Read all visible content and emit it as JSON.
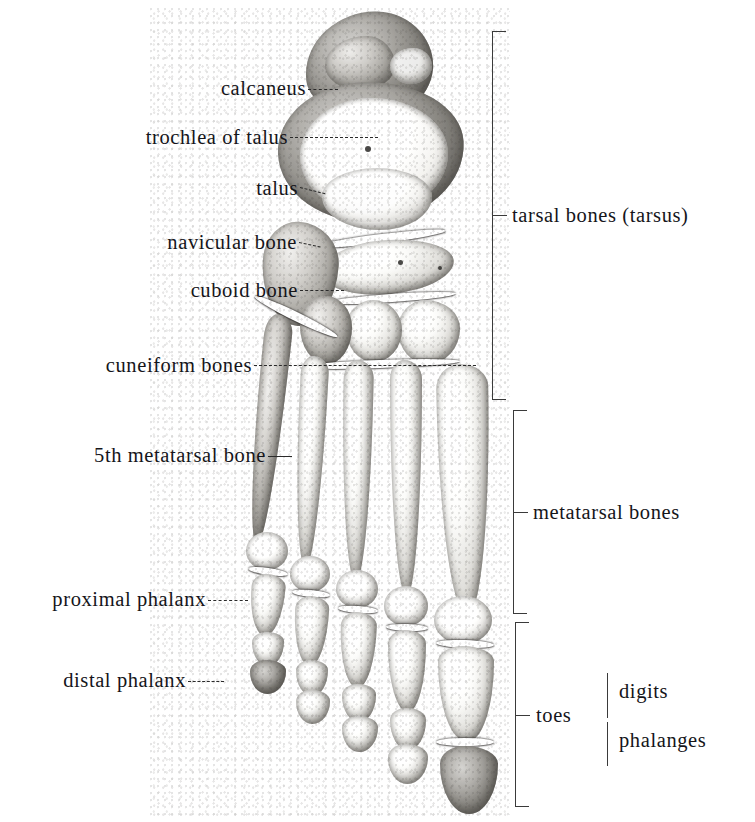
{
  "figure": {
    "style": "halftone grayscale anatomical photograph with leader-line labels"
  },
  "left_labels": [
    {
      "id": "calcaneus",
      "text": "calcaneus"
    },
    {
      "id": "trochlea-of-talus",
      "text": "trochlea of talus"
    },
    {
      "id": "talus",
      "text": "talus"
    },
    {
      "id": "navicular-bone",
      "text": "navicular bone"
    },
    {
      "id": "cuboid-bone",
      "text": "cuboid bone"
    },
    {
      "id": "cuneiform-bones",
      "text": "cuneiform bones"
    },
    {
      "id": "5th-metatarsal-bone",
      "text": "5th metatarsal bone"
    },
    {
      "id": "proximal-phalanx",
      "text": "proximal phalanx"
    },
    {
      "id": "distal-phalanx",
      "text": "distal phalanx"
    }
  ],
  "right_labels": [
    {
      "id": "tarsal-bones",
      "text": "tarsal bones (tarsus)"
    },
    {
      "id": "metatarsal-bones",
      "text": "metatarsal bones"
    },
    {
      "id": "toes",
      "text": "toes"
    },
    {
      "id": "digits",
      "text": "digits"
    },
    {
      "id": "phalanges",
      "text": "phalanges"
    }
  ],
  "colors": {
    "background": "#ffffff",
    "text": "#15151a",
    "bracket": "#3a3a3a",
    "leader": "#2a2a2a"
  }
}
